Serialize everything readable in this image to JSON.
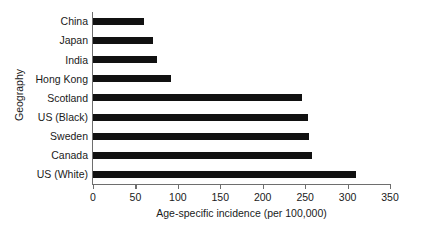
{
  "chart_data": {
    "type": "bar",
    "orientation": "horizontal",
    "title": "",
    "xlabel": "Age-specific incidence (per 100,000)",
    "ylabel": "Geography",
    "xlim": [
      0,
      350
    ],
    "xticks": [
      0,
      50,
      100,
      150,
      200,
      250,
      300,
      350
    ],
    "xtick_labels": [
      "0",
      "50",
      "100",
      "150",
      "200",
      "250",
      "300",
      "350"
    ],
    "grid": false,
    "legend": false,
    "bar_color": "#111111",
    "axis_color": "#6e6e6e",
    "categories": [
      "China",
      "Japan",
      "India",
      "Hong Kong",
      "Scotland",
      "US (Black)",
      "Sweden",
      "Canada",
      "US (White)"
    ],
    "values": [
      60,
      71,
      76,
      92,
      246,
      253,
      255,
      258,
      310
    ]
  }
}
